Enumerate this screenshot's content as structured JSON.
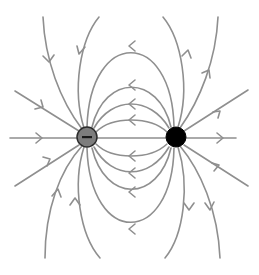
{
  "diagram": {
    "title": "",
    "charges": [
      {
        "id": "negative",
        "sign": "−",
        "cx": 87,
        "cy": 137,
        "r": 10,
        "fill": "#7d7d7d"
      },
      {
        "id": "positive",
        "sign": "",
        "cx": 176,
        "cy": 137,
        "r": 10,
        "fill": "#000000"
      }
    ],
    "line_color": "#8f8f8f",
    "field_direction": "from positive (right, black) to negative (left, gray)"
  }
}
